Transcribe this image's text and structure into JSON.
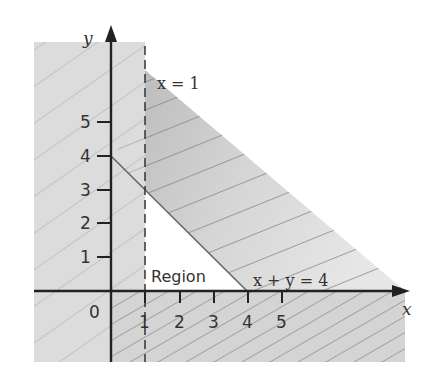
{
  "diagram": {
    "axes": {
      "x_label": "x",
      "y_label": "y",
      "origin_label": "0",
      "x_ticks": [
        "1",
        "2",
        "3",
        "4",
        "5"
      ],
      "y_ticks": [
        "1",
        "2",
        "3",
        "4",
        "5"
      ]
    },
    "lines": {
      "vertical": {
        "label": "x = 1",
        "style": "dashed"
      },
      "diagonal": {
        "label": "x + y = 4",
        "style": "solid"
      }
    },
    "region": {
      "label": "Region",
      "fill": "#ffffff"
    },
    "shading": {
      "excluded_fill": "#dcdcdc",
      "hatch_color": "#8a8a8a",
      "axis_color": "#222222"
    }
  }
}
